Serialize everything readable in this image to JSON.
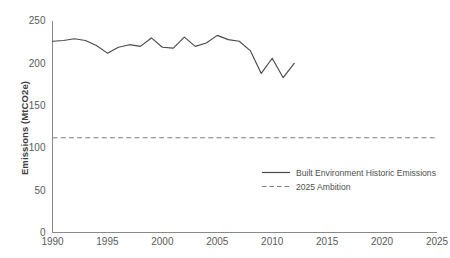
{
  "chart_data": {
    "type": "line",
    "title": "",
    "xlabel": "",
    "ylabel": "Emissions (MtCO2e)",
    "xlim": [
      1990,
      2025
    ],
    "ylim": [
      0,
      250
    ],
    "grid": false,
    "legend_position": "center-right-inside",
    "x_ticks": [
      "1990",
      "1995",
      "2000",
      "2005",
      "2010",
      "2015",
      "2020",
      "2025"
    ],
    "x_tick_values": [
      1990,
      1995,
      2000,
      2005,
      2010,
      2015,
      2020,
      2025
    ],
    "y_ticks": [
      "0",
      "50",
      "100",
      "150",
      "200",
      "250"
    ],
    "y_tick_values": [
      0,
      50,
      100,
      150,
      200,
      250
    ],
    "series": [
      {
        "name": "Built Environment Historic Emissions",
        "style": "solid",
        "color": "#4a4a4a",
        "x": [
          1990,
          1991,
          1992,
          1993,
          1994,
          1995,
          1996,
          1997,
          1998,
          1999,
          2000,
          2001,
          2002,
          2003,
          2004,
          2005,
          2006,
          2007,
          2008,
          2009,
          2010,
          2011,
          2012
        ],
        "values": [
          226,
          227,
          229,
          227,
          221,
          212,
          219,
          222,
          220,
          230,
          219,
          218,
          231,
          220,
          224,
          233,
          228,
          226,
          215,
          188,
          206,
          183,
          200
        ]
      },
      {
        "name": "2025 Ambition",
        "style": "dashed",
        "color": "#7d7d7d",
        "constant_value": 112,
        "x": [
          1990,
          2025
        ],
        "values": [
          112,
          112
        ]
      }
    ],
    "legend": [
      {
        "label": "Built Environment Historic Emissions",
        "style": "solid"
      },
      {
        "label": "2025 Ambition",
        "style": "dashed"
      }
    ]
  }
}
